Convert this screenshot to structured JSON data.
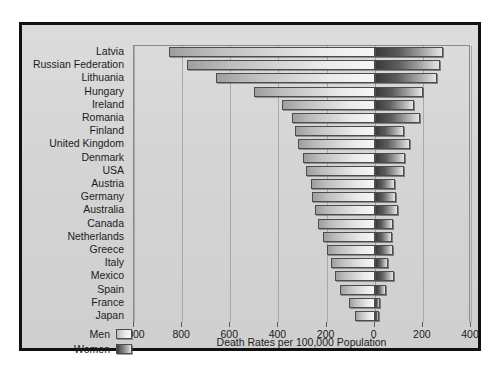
{
  "chart_data": {
    "type": "bar",
    "orientation": "horizontal",
    "layout": "bidirectional-pyramid",
    "title": "",
    "xlabel": "Death Rates per 100,000 Population",
    "ylabel": "",
    "grid": true,
    "legend_position": "bottom-left",
    "axis": {
      "left_max": 1000,
      "right_max": 400,
      "tick_values": [
        1000,
        800,
        600,
        400,
        200,
        0,
        200,
        400
      ],
      "tick_labels": [
        "1000",
        "800",
        "600",
        "400",
        "200",
        "0",
        "200",
        "400"
      ],
      "tick_signed": [
        -1000,
        -800,
        -600,
        -400,
        -200,
        0,
        200,
        400
      ]
    },
    "categories": [
      "Latvia",
      "Russian Federation",
      "Lithuania",
      "Hungary",
      "Ireland",
      "Romania",
      "Finland",
      "United Kingdom",
      "Denmark",
      "USA",
      "Austria",
      "Germany",
      "Australia",
      "Canada",
      "Netherlands",
      "Greece",
      "Italy",
      "Mexico",
      "Spain",
      "France",
      "Japan"
    ],
    "series": [
      {
        "name": "Men",
        "color": "#e9e9e9",
        "direction": "left",
        "values": [
          855,
          780,
          660,
          500,
          385,
          345,
          330,
          320,
          300,
          285,
          265,
          260,
          250,
          235,
          215,
          200,
          180,
          165,
          145,
          105,
          80
        ]
      },
      {
        "name": "Women",
        "color": "#4a4a4a",
        "direction": "right",
        "values": [
          282,
          272,
          258,
          200,
          165,
          190,
          120,
          145,
          125,
          120,
          85,
          90,
          95,
          75,
          70,
          75,
          55,
          80,
          45,
          22,
          18
        ]
      }
    ]
  },
  "legend": {
    "items": [
      {
        "label": "Men",
        "swatch": "men"
      },
      {
        "label": "Women",
        "swatch": "women"
      }
    ]
  }
}
